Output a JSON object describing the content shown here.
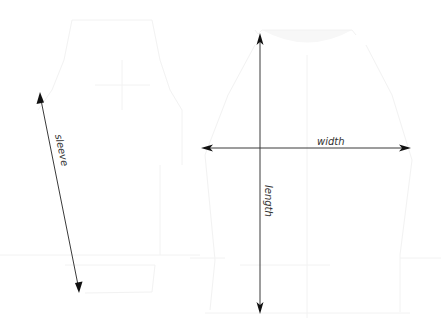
{
  "diagram": {
    "background": "#ffffff",
    "line_color": "#3a3a3a",
    "ghost_color": "#f2f2f2",
    "measurements": {
      "sleeve": {
        "label": "sleeve",
        "start": [
          40,
          93
        ],
        "end": [
          79,
          292
        ]
      },
      "width": {
        "label": "width",
        "start": [
          201,
          148
        ],
        "end": [
          410,
          148
        ]
      },
      "length": {
        "label": "length",
        "start": [
          260,
          33
        ],
        "end": [
          260,
          314
        ]
      }
    },
    "garments": [
      {
        "name": "sleeve-view",
        "description": "faint sleeve/jacket outline, left"
      },
      {
        "name": "body-view",
        "description": "faint garment body outline, right"
      }
    ]
  }
}
